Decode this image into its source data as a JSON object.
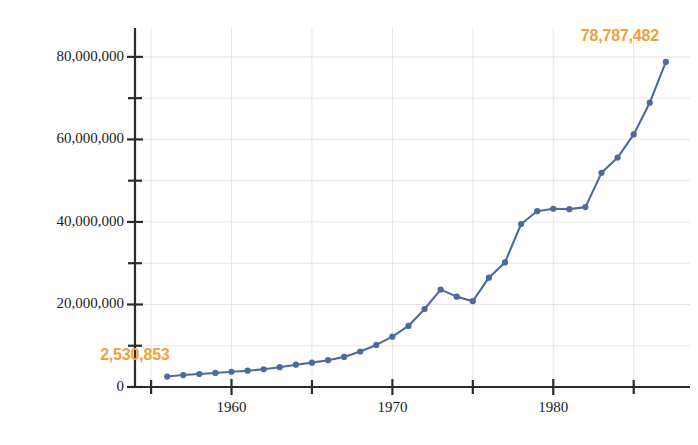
{
  "chart_data": {
    "type": "line",
    "title": "",
    "subtitle": "",
    "xlabel": "",
    "ylabel": "",
    "xlim": [
      1954.0,
      1988.5
    ],
    "ylim": [
      0,
      87000000
    ],
    "grid": true,
    "legend": "none",
    "series_name": "",
    "line_color": "#4d6a9e",
    "marker_color": "#4d6a9e",
    "annotation_color": "#f0a03c",
    "axis_color": "#2b2b2b",
    "gridline_color": "#e6e6e6",
    "background_color": "#ffffff",
    "x": [
      1956,
      1957,
      1958,
      1959,
      1960,
      1961,
      1962,
      1963,
      1964,
      1965,
      1966,
      1967,
      1968,
      1969,
      1970,
      1971,
      1972,
      1973,
      1974,
      1975,
      1976,
      1977,
      1978,
      1979,
      1980,
      1981,
      1982,
      1983,
      1984,
      1985,
      1986,
      1987
    ],
    "values": [
      2530853,
      2900000,
      3150000,
      3400000,
      3700000,
      3950000,
      4300000,
      4800000,
      5400000,
      5900000,
      6500000,
      7300000,
      8600000,
      10200000,
      12200000,
      14800000,
      18900000,
      23600000,
      21900000,
      20800000,
      26500000,
      30200000,
      39500000,
      42600000,
      43200000,
      43100000,
      43600000,
      51900000,
      55600000,
      61200000,
      68900000,
      78787482
    ],
    "y_ticks_major": [
      0,
      20000000,
      40000000,
      60000000,
      80000000
    ],
    "y_ticks_major_labels": [
      "0",
      "20,000,000",
      "40,000,000",
      "60,000,000",
      "80,000,000"
    ],
    "y_ticks_minor": [
      10000000,
      30000000,
      50000000,
      70000000
    ],
    "x_ticks_major": [
      1960,
      1970,
      1980
    ],
    "x_ticks_major_labels": [
      "1960",
      "1970",
      "1980"
    ],
    "x_ticks_minor": [
      1955,
      1965,
      1975,
      1985
    ],
    "annotations": [
      {
        "name": "first-value-annotation",
        "text": "2,530,853",
        "x": 1956,
        "y": 2530853
      },
      {
        "name": "last-value-annotation",
        "text": "78,787,482",
        "x": 1987,
        "y": 78787482
      }
    ]
  },
  "axis": {
    "y_labels": [
      "80,000,000",
      "60,000,000",
      "40,000,000",
      "20,000,000",
      "0"
    ],
    "x_labels": [
      "1960",
      "1970",
      "1980"
    ]
  },
  "annotations": {
    "start_label": "2,530,853",
    "end_label": "78,787,482"
  }
}
